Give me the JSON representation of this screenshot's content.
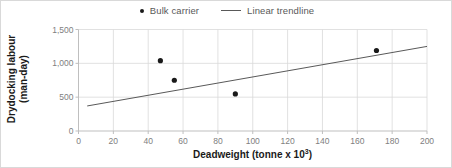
{
  "chart_data": {
    "type": "scatter",
    "title": "",
    "xlabel": "Deadweight (tonne x 10³)",
    "xlabel_base": "Deadweight (tonne x 10",
    "xlabel_sup": "3",
    "xlabel_tail": ")",
    "ylabel": "Drydocking labour (man-day)",
    "ylabel_line1": "Drydocking labour",
    "ylabel_line2": "(man-day)",
    "xlim": [
      0,
      200
    ],
    "ylim": [
      0,
      1500
    ],
    "xticks": [
      0,
      20,
      40,
      60,
      80,
      100,
      120,
      140,
      160,
      180,
      200
    ],
    "xticklabels": [
      "0",
      "20",
      "40",
      "60",
      "80",
      "100",
      "120",
      "140",
      "160",
      "180",
      "200"
    ],
    "yticks": [
      0,
      500,
      1000,
      1500
    ],
    "yticklabels": [
      "0",
      "500",
      "1,000",
      "1,500"
    ],
    "grid": true,
    "grid_color": "#d9d9d9",
    "legend_position": "top-center",
    "series": [
      {
        "name": "Bulk carrier",
        "type": "scatter",
        "marker": "circle",
        "color": "#1a1a1a",
        "points": [
          {
            "x": 47,
            "y": 1040
          },
          {
            "x": 55,
            "y": 750
          },
          {
            "x": 90,
            "y": 548
          },
          {
            "x": 171,
            "y": 1190
          }
        ]
      },
      {
        "name": "Linear trendline",
        "type": "line",
        "color": "#595959",
        "endpoints": [
          {
            "x": 5,
            "y": 370
          },
          {
            "x": 200,
            "y": 1250
          }
        ]
      }
    ]
  },
  "legend": {
    "items": [
      {
        "label": "Bulk carrier",
        "marker": "dot"
      },
      {
        "label": "Linear trendline",
        "marker": "line"
      }
    ]
  }
}
